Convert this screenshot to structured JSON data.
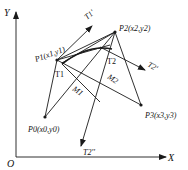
{
  "diagram": {
    "axes": {
      "x_label": "X",
      "y_label": "Y",
      "origin_label": "O"
    },
    "points": {
      "p0": "P0(x0,y0)",
      "p1": "P1(x1,y1)",
      "p2": "P2(x2,y2)",
      "p3": "P3(x3,y3)"
    },
    "tangent_points": {
      "t1": "T1",
      "t2": "T2"
    },
    "midpoints": {
      "m1": "M1",
      "m2": "M2"
    },
    "tangent_vectors": {
      "t1_prime": "T1'",
      "t2_prime": "T2'",
      "t2_double_prime": "T2''"
    },
    "colors": {
      "stroke": "#1a1a1a",
      "background": "#ffffff"
    }
  }
}
